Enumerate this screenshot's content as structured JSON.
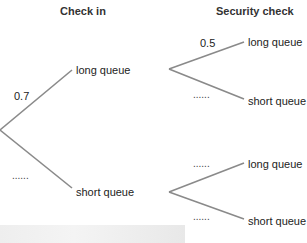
{
  "headers": {
    "stage1": "Check in",
    "stage2": "Security check"
  },
  "stage1": {
    "branches": [
      {
        "outcome": "long queue",
        "probability": "0.7"
      },
      {
        "outcome": "short queue",
        "probability": "......"
      }
    ]
  },
  "stage2": {
    "from_long": [
      {
        "outcome": "long queue",
        "probability": "0.5"
      },
      {
        "outcome": "short queue",
        "probability": "......"
      }
    ],
    "from_short": [
      {
        "outcome": "long queue",
        "probability": "......"
      },
      {
        "outcome": "short queue",
        "probability": "......"
      }
    ]
  },
  "colors": {
    "branch_line": "#8a8a8a",
    "text": "#222222"
  }
}
